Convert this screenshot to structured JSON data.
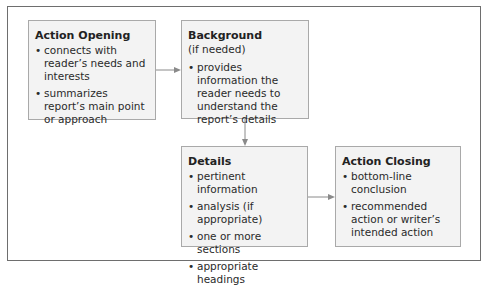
{
  "diagram": {
    "type": "flowchart",
    "colors": {
      "box_fill": "#f3f3f3",
      "box_border": "#a9a9a9",
      "frame_border": "#6e6e6e",
      "arrow": "#8a8a8a"
    },
    "boxes": [
      {
        "id": "action-opening",
        "title": "Action Opening",
        "subtitle": null,
        "bullets": [
          "connects with reader’s needs and interests",
          "summarizes report’s main point or approach"
        ]
      },
      {
        "id": "background",
        "title": "Background",
        "subtitle": "(if needed)",
        "bullets": [
          "provides information the reader needs to understand the report’s details"
        ]
      },
      {
        "id": "details",
        "title": "Details",
        "subtitle": null,
        "bullets": [
          "pertinent information",
          "analysis (if appropriate)",
          "one or more sections",
          "appropriate headings"
        ]
      },
      {
        "id": "action-closing",
        "title": "Action Closing",
        "subtitle": null,
        "bullets": [
          "bottom-line conclusion",
          "recommended action or writer’s intended action"
        ]
      }
    ],
    "edges": [
      {
        "from": "action-opening",
        "to": "background"
      },
      {
        "from": "background",
        "to": "details"
      },
      {
        "from": "details",
        "to": "action-closing"
      }
    ]
  }
}
